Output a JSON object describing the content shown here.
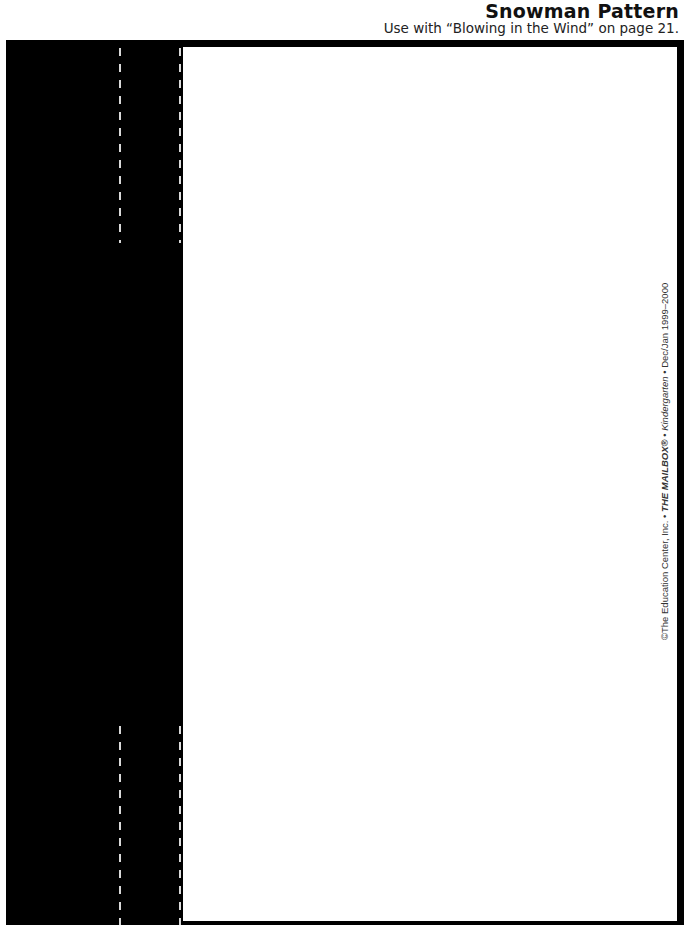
{
  "header": {
    "title": "Snowman Pattern",
    "subtitle": "Use with “Blowing in the Wind” on page 21."
  },
  "copyright": {
    "prefix": "©The Education Center, Inc. • ",
    "magazine": "THE MAILBOX®",
    "sep": " • ",
    "edition": "Kindergarten",
    "suffix": " • Dec/Jan 1999–2000"
  },
  "colors": {
    "panel": "#000000",
    "cut_line": "#d8d8d8",
    "page": "#ffffff"
  }
}
